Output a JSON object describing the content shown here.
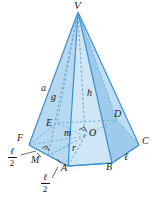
{
  "figure": {
    "kind": "hexagonal-pyramid-diagram",
    "colors": {
      "face_light": "#cfe6f7",
      "face_mid": "#aed3ee",
      "face_dark": "#8fc2e6",
      "base_fill": "#bcdcf2",
      "edge": "#3f8fce",
      "hidden_edge": "#6aa9d8",
      "label": "#1a1a1a"
    },
    "vertices": {
      "apex": "V",
      "base": [
        "A",
        "B",
        "C",
        "D",
        "E",
        "F"
      ],
      "center": "O",
      "midpoint": "M"
    }
  },
  "labels": {
    "apex": "V",
    "A": "A",
    "B": "B",
    "C": "C",
    "D": "D",
    "E": "E",
    "F": "F",
    "O": "O",
    "M": "M",
    "height": "h",
    "slant_height": "a",
    "apothem_slant": "g",
    "apothem": "m",
    "radius": "r",
    "side": "ℓ",
    "half_side_numerator": "ℓ",
    "half_side_denominator": "2"
  }
}
